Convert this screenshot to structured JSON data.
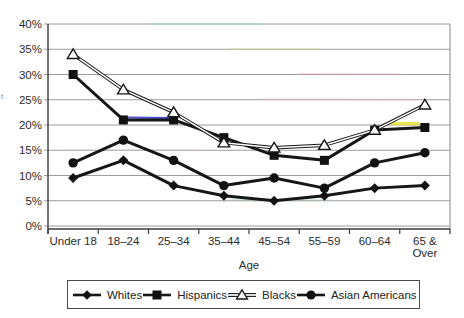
{
  "chart_data": {
    "type": "line",
    "title": "",
    "xlabel": "Age",
    "ylabel": "",
    "ylim": [
      0,
      40
    ],
    "ytick_step": 5,
    "ytick_labels": [
      "0%",
      "5%",
      "10%",
      "15%",
      "20%",
      "25%",
      "30%",
      "35%",
      "40%"
    ],
    "categories": [
      "Under 18",
      "18–24",
      "25–34",
      "35–44",
      "45–54",
      "55–59",
      "60–64",
      "65 &\nOver"
    ],
    "grid": "horizontal",
    "legend_position": "bottom",
    "series": [
      {
        "name": "Whites",
        "marker": "diamond",
        "line": "solid-thick",
        "values": [
          9.5,
          13,
          8,
          6,
          5,
          6,
          7.5,
          8
        ]
      },
      {
        "name": "Hispanics",
        "marker": "square",
        "line": "solid-thick",
        "values": [
          30,
          21,
          21,
          17.5,
          14,
          13,
          19,
          19.5
        ]
      },
      {
        "name": "Blacks",
        "marker": "triangle-open",
        "line": "double-thin",
        "values": [
          34,
          27,
          22.5,
          16.5,
          15.5,
          16,
          19,
          24
        ]
      },
      {
        "name": "Asian Americans",
        "marker": "circle",
        "line": "solid-thick",
        "values": [
          12.5,
          17,
          13,
          8,
          9.5,
          7.5,
          12.5,
          14.5
        ]
      }
    ]
  },
  "colors": {
    "line": "#161616",
    "grid": "#9c9c9c",
    "axis": "#3c3c3c",
    "text": "#2b2b2b",
    "background": "#ffffff",
    "legend_border": "#4a4a4a",
    "marker_fill": "#111111",
    "open_marker_fill": "#ffffff"
  },
  "axis_title_fragment": "t",
  "scan_artifacts": [
    {
      "x1": 128,
      "y1": 117.5,
      "x2": 172,
      "y2": 118.2,
      "color": "#2a35c8",
      "w": 2.2,
      "o": 0.85
    },
    {
      "x1": 392,
      "y1": 123.5,
      "x2": 418,
      "y2": 123.8,
      "color": "#e6e23c",
      "w": 3.5,
      "o": 0.85
    },
    {
      "x1": 150,
      "y1": 24,
      "x2": 260,
      "y2": 24,
      "color": "#7fd4c8",
      "w": 2,
      "o": 0.3
    },
    {
      "x1": 230,
      "y1": 49,
      "x2": 320,
      "y2": 49,
      "color": "#d9e08a",
      "w": 2,
      "o": 0.3
    },
    {
      "x1": 300,
      "y1": 74,
      "x2": 400,
      "y2": 74.3,
      "color": "#e9a0b4",
      "w": 2,
      "o": 0.35
    },
    {
      "x1": 260,
      "y1": 99,
      "x2": 420,
      "y2": 99.4,
      "color": "#e8b7c0",
      "w": 1.8,
      "o": 0.3
    },
    {
      "x1": 60,
      "y1": 150,
      "x2": 200,
      "y2": 150,
      "color": "#f0b9c4",
      "w": 1.5,
      "o": 0.28
    },
    {
      "x1": 230,
      "y1": 199.8,
      "x2": 330,
      "y2": 200,
      "color": "#7ec87e",
      "w": 1.6,
      "o": 0.33
    }
  ]
}
